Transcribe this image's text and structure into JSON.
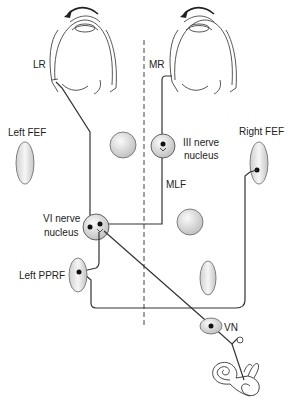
{
  "diagram": {
    "type": "neuroanatomy-pathway",
    "labels": {
      "lr": "LR",
      "mr": "MR",
      "left_fef": "Left FEF",
      "right_fef": "Right FEF",
      "iii_nerve_line1": "III nerve",
      "iii_nerve_line2": "nucleus",
      "mlf": "MLF",
      "vi_nerve_line1": "VI nerve",
      "vi_nerve_line2": "nucleus",
      "left_pprf": "Left PPRF",
      "vn": "VN"
    },
    "colors": {
      "line": "#333333",
      "nucleus_fill_light": "#f4f4f4",
      "nucleus_fill_dark": "#c8c8c8",
      "midline": "#444444"
    }
  }
}
